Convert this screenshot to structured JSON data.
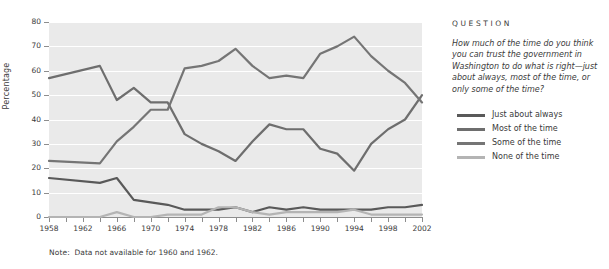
{
  "chart_data": {
    "type": "line",
    "title": "",
    "xlabel": "",
    "ylabel": "Percentage",
    "ylim": [
      0,
      80
    ],
    "xlim": [
      1958,
      2002
    ],
    "yticks": [
      0,
      10,
      20,
      30,
      40,
      50,
      60,
      70,
      80
    ],
    "xticks": [
      1958,
      1960,
      1962,
      1964,
      1966,
      1968,
      1970,
      1972,
      1974,
      1976,
      1978,
      1980,
      1982,
      1984,
      1986,
      1988,
      1990,
      1992,
      1994,
      1996,
      1998,
      2000,
      2002
    ],
    "xtick_labels": [
      "1958",
      "",
      "1962",
      "",
      "1966",
      "",
      "1970",
      "",
      "1974",
      "",
      "1978",
      "",
      "1982",
      "",
      "1986",
      "",
      "1990",
      "",
      "1994",
      "",
      "1998",
      "",
      "2002"
    ],
    "grid": "horizontal",
    "legend_position": "right",
    "note": "Note:  Data not available for 1960 and 1962.",
    "x": [
      1958,
      1964,
      1966,
      1968,
      1970,
      1972,
      1974,
      1976,
      1978,
      1980,
      1982,
      1984,
      1986,
      1988,
      1990,
      1992,
      1994,
      1996,
      1998,
      2000,
      2002
    ],
    "series": [
      {
        "name": "Just about always",
        "color": "#595959",
        "values": [
          16,
          14,
          16,
          7,
          6,
          5,
          3,
          3,
          3,
          4,
          2,
          4,
          3,
          4,
          3,
          3,
          3,
          3,
          4,
          4,
          5
        ]
      },
      {
        "name": "Most of the time",
        "color": "#6e6e6e",
        "values": [
          57,
          62,
          48,
          53,
          47,
          47,
          34,
          30,
          27,
          23,
          31,
          38,
          36,
          36,
          28,
          26,
          19,
          30,
          36,
          40,
          50
        ]
      },
      {
        "name": "Some of the time",
        "color": "#757575",
        "values": [
          23,
          22,
          31,
          37,
          44,
          44,
          61,
          62,
          64,
          69,
          62,
          57,
          58,
          57,
          67,
          70,
          74,
          66,
          60,
          55,
          47
        ]
      },
      {
        "name": "None of the time",
        "color": "#b4b4b4",
        "values": [
          0,
          0,
          2,
          0,
          0,
          1,
          1,
          1,
          4,
          4,
          2,
          1,
          2,
          2,
          2,
          2,
          3,
          1,
          1,
          1,
          1
        ]
      }
    ]
  },
  "axis": {
    "ylabel": "Percentage",
    "ytick_labels": [
      "0",
      "10",
      "20",
      "30",
      "40",
      "50",
      "60",
      "70",
      "80"
    ],
    "xtick_labels_visible": [
      "1958",
      "1962",
      "1966",
      "1970",
      "1974",
      "1978",
      "1982",
      "1986",
      "1990",
      "1994",
      "1998",
      "2002"
    ]
  },
  "note": {
    "label": "Note:",
    "text": "Data not available for 1960 and 1962."
  },
  "side": {
    "question_heading": "QUESTION",
    "question_text": "How much of the time do you think you can trust the government in Washington to do what is right—just about always, most of the time, or only some of the time?",
    "legend": [
      {
        "label": "Just about always",
        "color": "#595959"
      },
      {
        "label": "Most of the time",
        "color": "#6e6e6e"
      },
      {
        "label": "Some of the time",
        "color": "#757575"
      },
      {
        "label": "None of the time",
        "color": "#b4b4b4"
      }
    ]
  },
  "colors": {
    "plot_background": "#eaeaea",
    "gridline": "#ffffff",
    "axis": "#8d8d8d",
    "text": "#3a3a3a",
    "page_background": "#ffffff"
  }
}
